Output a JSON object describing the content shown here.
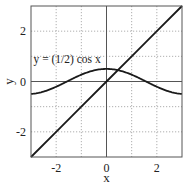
{
  "chart_data": {
    "type": "line",
    "title": "",
    "xlabel": "x",
    "ylabel": "y",
    "xlim": [
      -3,
      3
    ],
    "ylim": [
      -3,
      3
    ],
    "grid": true,
    "grid_style": "dotted",
    "axes_lines": {
      "x_zero": true,
      "y_zero": true
    },
    "x_ticks": [
      -2,
      0,
      2
    ],
    "x_tick_labels": [
      "-2",
      "0",
      "2"
    ],
    "y_ticks": [
      -2,
      0,
      2
    ],
    "y_tick_labels": [
      "-2",
      "0",
      "2"
    ],
    "grid_x": [
      -2,
      -1,
      1,
      2
    ],
    "grid_y": [
      -2,
      -1,
      1,
      2
    ],
    "series": [
      {
        "name": "y = x",
        "function": "x",
        "x": [
          -3,
          -2,
          -1,
          0,
          1,
          2,
          3
        ],
        "values": [
          -3,
          -2,
          -1,
          0,
          1,
          2,
          3
        ]
      },
      {
        "name": "y = (1/2) cos x",
        "function": "0.5*cos(x)",
        "x": [
          -3,
          -2.5,
          -2,
          -1.5,
          -1,
          -0.5,
          0,
          0.5,
          1,
          1.5,
          2,
          2.5,
          3
        ],
        "values": [
          -0.495,
          -0.401,
          -0.208,
          0.035,
          0.27,
          0.439,
          0.5,
          0.439,
          0.27,
          0.035,
          -0.208,
          -0.401,
          -0.495
        ]
      }
    ],
    "annotations": [
      {
        "text": "y = (1/2) cos x",
        "x": -2.9,
        "y": 0.75
      }
    ],
    "legend": null
  },
  "colors": {
    "line": "#1a1a1a",
    "frame": "#555555",
    "grid": "#9a9a9a",
    "text": "#222222"
  }
}
